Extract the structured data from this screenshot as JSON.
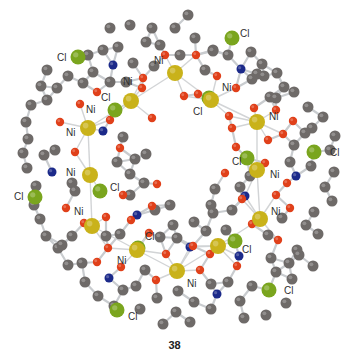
{
  "figure": {
    "caption": "38",
    "element_colors": {
      "Ni": "#c9b21a",
      "Cl": "#7aa51e",
      "O": "#e0401a",
      "N": "#1c2a8a",
      "C": "#6e6a68",
      "bond": "#c9cccf"
    },
    "atom_radii": {
      "Ni": 8,
      "Cl": 7.5,
      "O": 4.2,
      "N": 4.5,
      "C": 5.5
    },
    "nickel_atoms": [
      {
        "id": "ni1",
        "x": 175,
        "y": 73,
        "label": "Ni",
        "lx": 154,
        "ly": 64
      },
      {
        "id": "ni2",
        "x": 131,
        "y": 101,
        "label": "Ni",
        "lx": 123,
        "ly": 85
      },
      {
        "id": "ni3",
        "x": 211,
        "y": 100,
        "label": "Ni",
        "lx": 222,
        "ly": 91
      },
      {
        "id": "ni4",
        "x": 88,
        "y": 128,
        "label": "Ni",
        "lx": 86,
        "ly": 113
      },
      {
        "id": "ni5",
        "x": 257,
        "y": 122,
        "label": "Ni",
        "lx": 269,
        "ly": 120
      },
      {
        "id": "ni6",
        "x": 90,
        "y": 175,
        "label": "Ni",
        "lx": 66,
        "ly": 136
      },
      {
        "id": "ni7",
        "x": 257,
        "y": 170,
        "label": "Ni",
        "lx": 270,
        "ly": 178
      },
      {
        "id": "ni8",
        "x": 92,
        "y": 226,
        "label": "Ni",
        "lx": 66,
        "ly": 176
      },
      {
        "id": "ni9",
        "x": 260,
        "y": 219,
        "label": "Ni",
        "lx": 271,
        "ly": 215
      },
      {
        "id": "ni10",
        "x": 137,
        "y": 250,
        "label": "Ni",
        "lx": 74,
        "ly": 215
      },
      {
        "id": "ni11",
        "x": 218,
        "y": 246,
        "label": "Ni",
        "lx": 117,
        "ly": 264
      },
      {
        "id": "ni12",
        "x": 177,
        "y": 271,
        "label": "Ni",
        "lx": 187,
        "ly": 287
      }
    ],
    "extra_ni_labels": [
      {
        "label": "Ni",
        "x": 216,
        "y": 266
      },
      {
        "label": "Ni",
        "x": 185,
        "y": 286
      }
    ],
    "chlorine_atoms": [
      {
        "id": "cl1",
        "x": 78,
        "y": 57,
        "label": "Cl",
        "lx": 57,
        "ly": 61
      },
      {
        "id": "cl2",
        "x": 232,
        "y": 38,
        "label": "Cl",
        "lx": 240,
        "ly": 37
      },
      {
        "id": "cl3",
        "x": 115,
        "y": 110,
        "label": "Cl",
        "lx": 101,
        "ly": 101
      },
      {
        "id": "cl4",
        "x": 209,
        "y": 98,
        "label": "Cl",
        "lx": 193,
        "ly": 115
      },
      {
        "id": "cl5",
        "x": 314,
        "y": 152,
        "label": "Cl",
        "lx": 330,
        "ly": 156
      },
      {
        "id": "cl6",
        "x": 247,
        "y": 158,
        "label": "Cl",
        "lx": 232,
        "ly": 165
      },
      {
        "id": "cl7",
        "x": 35,
        "y": 197,
        "label": "Cl",
        "lx": 14,
        "ly": 200
      },
      {
        "id": "cl8",
        "x": 100,
        "y": 191,
        "label": "Cl",
        "lx": 110,
        "ly": 191
      },
      {
        "id": "cl9",
        "x": 138,
        "y": 248,
        "label": "Cl",
        "lx": 145,
        "ly": 240
      },
      {
        "id": "cl10",
        "x": 235,
        "y": 241,
        "label": "Cl",
        "lx": 242,
        "ly": 253
      },
      {
        "id": "cl11",
        "x": 117,
        "y": 310,
        "label": "Cl",
        "lx": 128,
        "ly": 320
      },
      {
        "id": "cl12",
        "x": 269,
        "y": 290,
        "label": "Cl",
        "lx": 284,
        "ly": 294
      }
    ],
    "oxygen_atoms": [
      [
        165,
        55
      ],
      [
        196,
        55
      ],
      [
        143,
        78
      ],
      [
        217,
        76
      ],
      [
        97,
        92
      ],
      [
        142,
        88
      ],
      [
        198,
        94
      ],
      [
        236,
        88
      ],
      [
        184,
        96
      ],
      [
        110,
        120
      ],
      [
        80,
        104
      ],
      [
        152,
        118
      ],
      [
        254,
        108
      ],
      [
        276,
        110
      ],
      [
        229,
        116
      ],
      [
        268,
        140
      ],
      [
        293,
        121
      ],
      [
        232,
        128
      ],
      [
        283,
        134
      ],
      [
        75,
        152
      ],
      [
        60,
        122
      ],
      [
        120,
        148
      ],
      [
        236,
        147
      ],
      [
        265,
        163
      ],
      [
        287,
        183
      ],
      [
        66,
        208
      ],
      [
        106,
        217
      ],
      [
        84,
        223
      ],
      [
        123,
        195
      ],
      [
        108,
        248
      ],
      [
        152,
        206
      ],
      [
        242,
        199
      ],
      [
        276,
        195
      ],
      [
        290,
        208
      ],
      [
        252,
        224
      ],
      [
        278,
        240
      ],
      [
        157,
        184
      ],
      [
        225,
        173
      ],
      [
        97,
        262
      ],
      [
        121,
        267
      ],
      [
        166,
        254
      ],
      [
        193,
        246
      ],
      [
        156,
        280
      ],
      [
        200,
        270
      ],
      [
        210,
        254
      ],
      [
        237,
        266
      ],
      [
        131,
        220
      ],
      [
        149,
        233
      ]
    ],
    "nitrogen_atoms": [
      [
        113,
        65
      ],
      [
        241,
        69
      ],
      [
        103,
        131
      ],
      [
        245,
        196
      ],
      [
        52,
        172
      ],
      [
        239,
        256
      ],
      [
        109,
        278
      ],
      [
        190,
        247
      ],
      [
        296,
        176
      ],
      [
        137,
        215
      ],
      [
        217,
        294
      ]
    ],
    "carbon_atoms": [
      [
        110,
        28
      ],
      [
        130,
        25
      ],
      [
        152,
        28
      ],
      [
        175,
        28
      ],
      [
        195,
        38
      ],
      [
        213,
        50
      ],
      [
        188,
        15
      ],
      [
        118,
        47
      ],
      [
        103,
        50
      ],
      [
        133,
        63
      ],
      [
        146,
        42
      ],
      [
        160,
        45
      ],
      [
        154,
        66
      ],
      [
        180,
        55
      ],
      [
        205,
        70
      ],
      [
        213,
        51
      ],
      [
        228,
        55
      ],
      [
        251,
        52
      ],
      [
        257,
        74
      ],
      [
        264,
        76
      ],
      [
        270,
        97
      ],
      [
        252,
        79
      ],
      [
        262,
        64
      ],
      [
        277,
        73
      ],
      [
        284,
        87
      ],
      [
        276,
        98
      ],
      [
        294,
        92
      ],
      [
        308,
        107
      ],
      [
        312,
        128
      ],
      [
        305,
        133
      ],
      [
        323,
        117
      ],
      [
        335,
        136
      ],
      [
        330,
        150
      ],
      [
        311,
        166
      ],
      [
        334,
        172
      ],
      [
        325,
        187
      ],
      [
        332,
        201
      ],
      [
        314,
        212
      ],
      [
        306,
        225
      ],
      [
        318,
        234
      ],
      [
        297,
        250
      ],
      [
        289,
        263
      ],
      [
        276,
        272
      ],
      [
        292,
        279
      ],
      [
        286,
        303
      ],
      [
        266,
        315
      ],
      [
        244,
        318
      ],
      [
        240,
        301
      ],
      [
        252,
        286
      ],
      [
        211,
        309
      ],
      [
        190,
        322
      ],
      [
        176,
        312
      ],
      [
        178,
        291
      ],
      [
        157,
        298
      ],
      [
        140,
        309
      ],
      [
        123,
        290
      ],
      [
        114,
        306
      ],
      [
        98,
        296
      ],
      [
        85,
        282
      ],
      [
        82,
        263
      ],
      [
        68,
        265
      ],
      [
        58,
        248
      ],
      [
        46,
        236
      ],
      [
        40,
        219
      ],
      [
        34,
        205
      ],
      [
        36,
        186
      ],
      [
        27,
        168
      ],
      [
        23,
        153
      ],
      [
        28,
        139
      ],
      [
        26,
        122
      ],
      [
        31,
        105
      ],
      [
        47,
        100
      ],
      [
        57,
        88
      ],
      [
        41,
        86
      ],
      [
        47,
        70
      ],
      [
        68,
        76
      ],
      [
        83,
        83
      ],
      [
        93,
        72
      ],
      [
        88,
        55
      ],
      [
        110,
        82
      ],
      [
        126,
        82
      ],
      [
        123,
        137
      ],
      [
        135,
        159
      ],
      [
        130,
        174
      ],
      [
        146,
        154
      ],
      [
        144,
        183
      ],
      [
        155,
        210
      ],
      [
        170,
        205
      ],
      [
        173,
        225
      ],
      [
        194,
        222
      ],
      [
        206,
        231
      ],
      [
        211,
        205
      ],
      [
        215,
        189
      ],
      [
        213,
        213
      ],
      [
        232,
        210
      ],
      [
        226,
        230
      ],
      [
        177,
        238
      ],
      [
        160,
        237
      ],
      [
        120,
        234
      ],
      [
        106,
        236
      ],
      [
        130,
        195
      ],
      [
        117,
        162
      ],
      [
        72,
        183
      ],
      [
        75,
        191
      ],
      [
        55,
        150
      ],
      [
        44,
        155
      ],
      [
        72,
        236
      ],
      [
        62,
        245
      ],
      [
        271,
        258
      ],
      [
        290,
        162
      ],
      [
        294,
        145
      ],
      [
        250,
        176
      ],
      [
        240,
        187
      ],
      [
        282,
        218
      ],
      [
        268,
        235
      ],
      [
        299,
        255
      ],
      [
        313,
        266
      ],
      [
        228,
        282
      ],
      [
        211,
        284
      ],
      [
        194,
        302
      ],
      [
        163,
        324
      ],
      [
        145,
        270
      ],
      [
        136,
        286
      ]
    ]
  }
}
